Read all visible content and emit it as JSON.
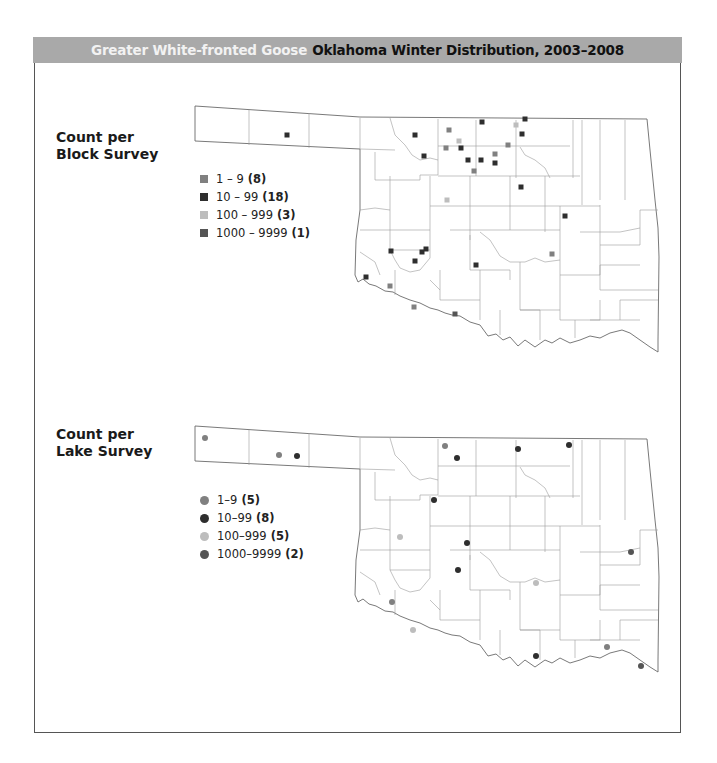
{
  "header": {
    "species": "Greater White-fronted Goose",
    "subtitle": "Oklahoma Winter Distribution, 2003–2008"
  },
  "colors": {
    "header_bg": "#a9a9a9",
    "class_1_9": "#808080",
    "class_10_99": "#2e2e2e",
    "class_100_999": "#bdbdbd",
    "class_1000_9999": "#555555",
    "county_line": "#9a9a9a",
    "state_line": "#6a6a6a"
  },
  "block_survey": {
    "label_line1": "Count per",
    "label_line2": "Block Survey",
    "marker": "square",
    "legend": [
      {
        "range": "1 – 9",
        "count": "(8)",
        "class": "class_1_9"
      },
      {
        "range": "10 – 99",
        "count": "(18)",
        "class": "class_10_99"
      },
      {
        "range": "100 – 999",
        "count": "(3)",
        "class": "class_100_999"
      },
      {
        "range": "1000 – 9999",
        "count": "(1)",
        "class": "class_1000_9999"
      }
    ],
    "points": [
      {
        "x": 287,
        "y": 135,
        "class": "class_10_99"
      },
      {
        "x": 415,
        "y": 135,
        "class": "class_10_99"
      },
      {
        "x": 424,
        "y": 156,
        "class": "class_10_99"
      },
      {
        "x": 449,
        "y": 130,
        "class": "class_1_9"
      },
      {
        "x": 446,
        "y": 148,
        "class": "class_1_9"
      },
      {
        "x": 459,
        "y": 141,
        "class": "class_100_999"
      },
      {
        "x": 461,
        "y": 148,
        "class": "class_10_99"
      },
      {
        "x": 482,
        "y": 122,
        "class": "class_10_99"
      },
      {
        "x": 468,
        "y": 160,
        "class": "class_10_99"
      },
      {
        "x": 481,
        "y": 160,
        "class": "class_10_99"
      },
      {
        "x": 474,
        "y": 171,
        "class": "class_1_9"
      },
      {
        "x": 495,
        "y": 154,
        "class": "class_1_9"
      },
      {
        "x": 495,
        "y": 163,
        "class": "class_10_99"
      },
      {
        "x": 508,
        "y": 145,
        "class": "class_1_9"
      },
      {
        "x": 516,
        "y": 125,
        "class": "class_100_999"
      },
      {
        "x": 525,
        "y": 119,
        "class": "class_10_99"
      },
      {
        "x": 522,
        "y": 134,
        "class": "class_10_99"
      },
      {
        "x": 521,
        "y": 187,
        "class": "class_10_99"
      },
      {
        "x": 447,
        "y": 200,
        "class": "class_100_999"
      },
      {
        "x": 565,
        "y": 216,
        "class": "class_10_99"
      },
      {
        "x": 552,
        "y": 254,
        "class": "class_1_9"
      },
      {
        "x": 476,
        "y": 265,
        "class": "class_10_99"
      },
      {
        "x": 391,
        "y": 251,
        "class": "class_10_99"
      },
      {
        "x": 422,
        "y": 252,
        "class": "class_10_99"
      },
      {
        "x": 426,
        "y": 249,
        "class": "class_10_99"
      },
      {
        "x": 415,
        "y": 261,
        "class": "class_10_99"
      },
      {
        "x": 366,
        "y": 277,
        "class": "class_10_99"
      },
      {
        "x": 390,
        "y": 286,
        "class": "class_1_9"
      },
      {
        "x": 414,
        "y": 307,
        "class": "class_1_9"
      },
      {
        "x": 455,
        "y": 314,
        "class": "class_1000_9999"
      }
    ]
  },
  "lake_survey": {
    "label_line1": "Count per",
    "label_line2": "Lake Survey",
    "marker": "circle",
    "legend": [
      {
        "range": "1–9",
        "count": "(5)",
        "class": "class_1_9"
      },
      {
        "range": "10–99",
        "count": "(8)",
        "class": "class_10_99"
      },
      {
        "range": "100–999",
        "count": "(5)",
        "class": "class_100_999"
      },
      {
        "range": "1000–9999",
        "count": "(2)",
        "class": "class_1000_9999"
      }
    ],
    "points": [
      {
        "x": 205,
        "y": 438,
        "class": "class_1_9"
      },
      {
        "x": 279,
        "y": 455,
        "class": "class_1_9"
      },
      {
        "x": 297,
        "y": 456,
        "class": "class_10_99"
      },
      {
        "x": 445,
        "y": 446,
        "class": "class_1_9"
      },
      {
        "x": 457,
        "y": 458,
        "class": "class_10_99"
      },
      {
        "x": 518,
        "y": 449,
        "class": "class_10_99"
      },
      {
        "x": 569,
        "y": 445,
        "class": "class_10_99"
      },
      {
        "x": 434,
        "y": 500,
        "class": "class_10_99"
      },
      {
        "x": 400,
        "y": 537,
        "class": "class_100_999"
      },
      {
        "x": 467,
        "y": 543,
        "class": "class_10_99"
      },
      {
        "x": 458,
        "y": 570,
        "class": "class_10_99"
      },
      {
        "x": 392,
        "y": 602,
        "class": "class_1_9"
      },
      {
        "x": 413,
        "y": 630,
        "class": "class_100_999"
      },
      {
        "x": 536,
        "y": 583,
        "class": "class_100_999"
      },
      {
        "x": 631,
        "y": 552,
        "class": "class_1000_9999"
      },
      {
        "x": 536,
        "y": 656,
        "class": "class_10_99"
      },
      {
        "x": 607,
        "y": 647,
        "class": "class_1_9"
      },
      {
        "x": 641,
        "y": 666,
        "class": "class_1000_9999"
      }
    ]
  }
}
